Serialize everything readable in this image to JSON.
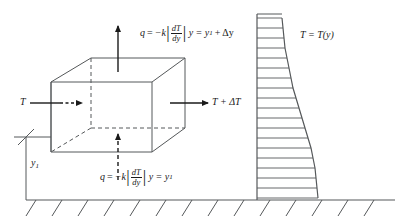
{
  "diagram": {
    "stroke_color": "#55585a",
    "text_color": "#1a1a1a",
    "labels": {
      "flux_top": {
        "q": "q",
        "equals": "=",
        "minus_k": "−k",
        "numerator": "dT",
        "denominator": "dy",
        "location": "y = y",
        "sub": "1",
        "plus_delta": "+ Δy"
      },
      "flux_bottom": {
        "q": "q",
        "equals": "=",
        "minus_k": "−k",
        "numerator": "dT",
        "denominator": "dy",
        "location": "y = y",
        "sub": "1"
      },
      "temp_in": "T",
      "temp_out": "T + ΔT",
      "profile": "T = T(y)",
      "height": "y",
      "height_sub": "1"
    }
  },
  "chart_data": {
    "type": "line",
    "title": "T = T(y)",
    "xlabel": "T",
    "ylabel": "y",
    "axis_x_px": 257,
    "axis_top_px": 14,
    "axis_bottom_px": 200,
    "grid": false,
    "legend": "none",
    "ticks": [
      {
        "y": 18,
        "len": 25
      },
      {
        "y": 28,
        "len": 26
      },
      {
        "y": 38,
        "len": 27
      },
      {
        "y": 48,
        "len": 28
      },
      {
        "y": 58,
        "len": 30
      },
      {
        "y": 68,
        "len": 32
      },
      {
        "y": 78,
        "len": 34
      },
      {
        "y": 88,
        "len": 36
      },
      {
        "y": 98,
        "len": 39
      },
      {
        "y": 108,
        "len": 42
      },
      {
        "y": 118,
        "len": 45
      },
      {
        "y": 128,
        "len": 48
      },
      {
        "y": 138,
        "len": 51
      },
      {
        "y": 148,
        "len": 54
      },
      {
        "y": 158,
        "len": 56
      },
      {
        "y": 168,
        "len": 58
      },
      {
        "y": 178,
        "len": 59
      },
      {
        "y": 188,
        "len": 60
      },
      {
        "y": 198,
        "len": 61
      }
    ]
  }
}
